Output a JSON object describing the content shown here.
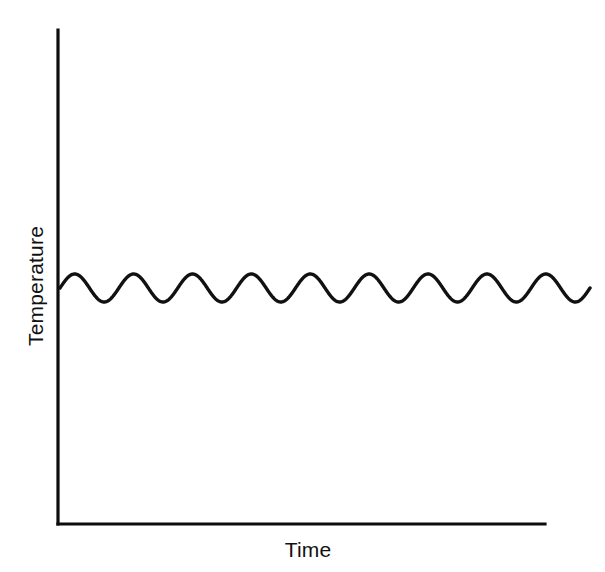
{
  "chart_data": {
    "type": "line",
    "title": "",
    "subtitle": "",
    "xlabel": "Time",
    "ylabel": "Temperature",
    "legend": [],
    "legend_position": "none",
    "grid": false,
    "ticks": {
      "x": [],
      "y": []
    },
    "axis_style": {
      "spines": [
        "left",
        "bottom"
      ],
      "arrowheads": false,
      "tick_marks": false,
      "color": "#111111"
    },
    "xlim": [
      0,
      9
    ],
    "ylim": [
      0,
      1
    ],
    "series": [
      {
        "name": "temperature",
        "shape": "sine",
        "periods": 9,
        "mean_level": 0.5,
        "amplitude": 0.028,
        "phase_deg": 0,
        "trend": "flat",
        "color": "#111111",
        "line_width": 3.4,
        "x_start_fraction": 0.0,
        "x_end_fraction": 1.0,
        "x": [
          0.0,
          0.25,
          0.5,
          0.75,
          1.0,
          1.25,
          1.5,
          1.75,
          2.0,
          2.25,
          2.5,
          2.75,
          3.0,
          3.25,
          3.5,
          3.75,
          4.0,
          4.25,
          4.5,
          4.75,
          5.0,
          5.25,
          5.5,
          5.75,
          6.0,
          6.25,
          6.5,
          6.75,
          7.0,
          7.25,
          7.5,
          7.75,
          8.0,
          8.25,
          8.5,
          8.75,
          9.0
        ],
        "values": [
          0.5,
          0.528,
          0.5,
          0.472,
          0.5,
          0.528,
          0.5,
          0.472,
          0.5,
          0.528,
          0.5,
          0.472,
          0.5,
          0.528,
          0.5,
          0.472,
          0.5,
          0.528,
          0.5,
          0.472,
          0.5,
          0.528,
          0.5,
          0.472,
          0.5,
          0.528,
          0.5,
          0.472,
          0.5,
          0.528,
          0.5,
          0.472,
          0.5,
          0.528,
          0.5,
          0.472,
          0.5
        ]
      }
    ]
  },
  "geometry": {
    "axis_origin_x": 58,
    "axis_origin_y": 524,
    "axis_top_y": 30,
    "axis_right_x": 545,
    "curve_start_x": 60,
    "curve_end_x": 590,
    "curve_mid_y": 288,
    "curve_crest_y": 274,
    "curve_trough_y": 302
  },
  "colors": {
    "background": "#ffffff",
    "ink": "#111111",
    "axis": "#0d0d0d"
  }
}
